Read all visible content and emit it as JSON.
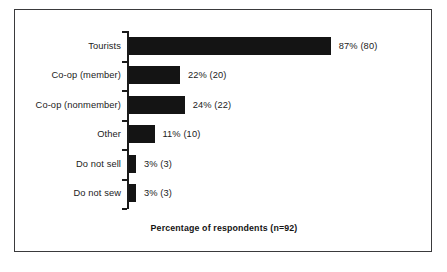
{
  "chart_data": {
    "type": "bar",
    "orientation": "horizontal",
    "title": "",
    "xlabel": "Percentage of respondents (n=92)",
    "ylabel": "",
    "categories": [
      "Tourists",
      "Co-op (member)",
      "Co-op (nonmember)",
      "Other",
      "Do not sell",
      "Do not sew"
    ],
    "values": [
      87,
      22,
      24,
      11,
      3,
      3
    ],
    "counts": [
      80,
      20,
      22,
      10,
      3,
      3
    ],
    "data_labels": [
      "87% (80)",
      "22% (20)",
      "24% (22)",
      "11% (10)",
      "3% (3)",
      "3% (3)"
    ],
    "xlim": [
      0,
      100
    ],
    "grid": false,
    "legend": false,
    "total_respondents": 92,
    "series": [
      {
        "name": "Percentage of respondents",
        "values": [
          87,
          22,
          24,
          11,
          3,
          3
        ]
      }
    ]
  },
  "figure": {
    "caption": "Percentage of respondents (n=92)",
    "bar_color": "#141414",
    "axis_color": "#1a1a1a",
    "frame_color": "#3a3a3c",
    "background_color": "#ffffff",
    "text_color": "#1b1b1b"
  }
}
